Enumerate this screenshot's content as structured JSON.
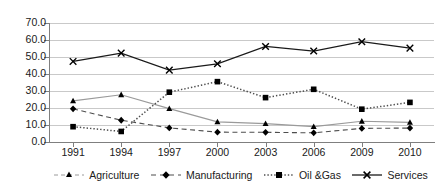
{
  "chart_data": {
    "type": "line",
    "title": "",
    "subtitle": "",
    "xlabel": "",
    "ylabel": "",
    "categories": [
      "1991",
      "1994",
      "1997",
      "2000",
      "2003",
      "2006",
      "2009",
      "2010"
    ],
    "x": [
      1991,
      1994,
      1997,
      2000,
      2003,
      2006,
      2009,
      2010
    ],
    "ylim": [
      0.0,
      70.0
    ],
    "yticks": [
      "0.0",
      "10.0",
      "20.0",
      "30.0",
      "40.0",
      "50.0",
      "60.0",
      "70.0"
    ],
    "ytick_values": [
      0.0,
      10.0,
      20.0,
      30.0,
      40.0,
      50.0,
      60.0,
      70.0
    ],
    "grid": true,
    "grid_axis": "y",
    "legend_position": "bottom",
    "series": [
      {
        "name": "Agriculture",
        "marker": "triangle",
        "line_style": "solid",
        "color": "#9a9a9a",
        "marker_color": "#000000",
        "values": [
          24.2,
          27.8,
          19.6,
          11.8,
          10.8,
          9.0,
          12.2,
          11.5
        ]
      },
      {
        "name": "Manufacturing",
        "marker": "diamond",
        "line_style": "dashed",
        "color": "#4d4d4d",
        "marker_color": "#000000",
        "values": [
          19.5,
          12.8,
          8.3,
          5.8,
          5.7,
          5.4,
          8.0,
          8.2
        ]
      },
      {
        "name": "Oil &Gas",
        "marker": "square",
        "line_style": "dotted",
        "color": "#4d4d4d",
        "marker_color": "#000000",
        "values": [
          9.0,
          6.2,
          29.3,
          35.5,
          26.1,
          31.0,
          19.3,
          23.3
        ]
      },
      {
        "name": "Services",
        "marker": "cross",
        "line_style": "solid",
        "color": "#1a1a1a",
        "marker_color": "#000000",
        "values": [
          47.4,
          52.3,
          42.3,
          46.0,
          56.2,
          53.5,
          59.0,
          55.2
        ]
      }
    ]
  },
  "legend": {
    "items": [
      {
        "label": "Agriculture"
      },
      {
        "label": "Manufacturing"
      },
      {
        "label": "Oil &Gas"
      },
      {
        "label": "Services"
      }
    ]
  },
  "colors": {
    "grid": "#c9c9c9",
    "axis": "#7f7f7f",
    "text": "#202020",
    "background": "#ffffff"
  }
}
